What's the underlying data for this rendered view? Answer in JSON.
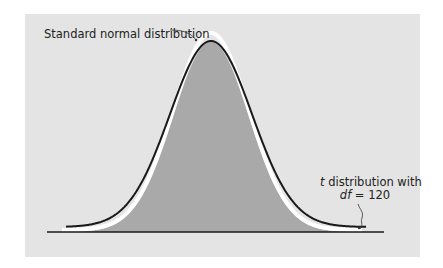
{
  "chart_data": {
    "type": "line",
    "title": "",
    "xlabel": "",
    "ylabel": "",
    "grid": false,
    "series": [
      {
        "name": "Standard normal distribution",
        "color": "#ffffff",
        "distribution": "normal",
        "mean": 0,
        "sd": 1
      },
      {
        "name": "t distribution with df = 120",
        "color": "#1a1a1a",
        "distribution": "t",
        "df": 120
      }
    ],
    "fill": {
      "color": "#a9a9a9",
      "under": "t distribution"
    },
    "annotations": [
      {
        "text": "Standard normal distribution",
        "points_to": "Standard normal distribution curve peak"
      },
      {
        "text": "t distribution with df = 120",
        "points_to": "t distribution right tail"
      }
    ]
  },
  "labels": {
    "normal": "Standard normal distribution",
    "t_line1_prefix": "t",
    "t_line1_rest": " distribution with",
    "t_line2_prefix": "df",
    "t_line2_rest": " = 120"
  },
  "colors": {
    "panel": "#e4e4e4",
    "fill": "#a9a9a9",
    "normal_curve": "#ffffff",
    "t_curve": "#1a1a1a",
    "axis": "#1a1a1a"
  }
}
